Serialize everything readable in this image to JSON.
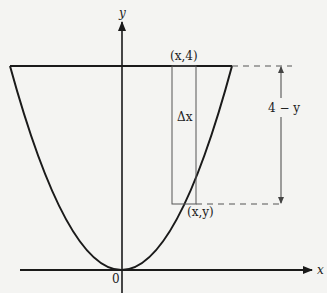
{
  "figure": {
    "labels": {
      "y_axis": "y",
      "x_axis": "x",
      "origin": "0",
      "top_point": "(x,4)",
      "curve_point": "(x,y)",
      "strip_width": "Δx",
      "height": "4 − y"
    },
    "colors": {
      "line": "#1a1a1a",
      "thin": "#555555",
      "background": "#f4f4f2"
    }
  }
}
